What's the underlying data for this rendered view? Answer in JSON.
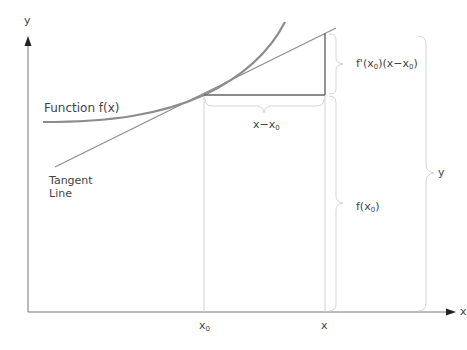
{
  "diagram": {
    "axes": {
      "x_label": "x",
      "y_label": "y"
    },
    "labels": {
      "function": "Function f(x)",
      "tangent_line1": "Tangent",
      "tangent_line2": "Line",
      "dx_a": "x",
      "dx_b": "x",
      "dx_sub": "0",
      "deriv_pre": "f'(x",
      "deriv_sub": "0",
      "deriv_mid": ")(x",
      "deriv_sub2": "0",
      "deriv_end": ")",
      "fx0_pre": "f(x",
      "fx0_sub": "0",
      "fx0_end": ")",
      "y_brace": "y",
      "tick_x0": "x",
      "tick_x0_sub": "0",
      "tick_x": "x"
    },
    "colors": {
      "curve": "#8a8a8a",
      "tangent": "#8a8a8a",
      "guides": "#d0d0d0",
      "axis": "#666666",
      "text": "#444444"
    }
  }
}
